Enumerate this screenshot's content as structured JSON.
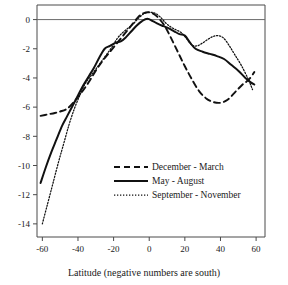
{
  "chart_data": {
    "type": "line",
    "title": "",
    "xlabel": "Latitude (negative numbers are south)",
    "ylabel": "",
    "xlim": [
      -63,
      65
    ],
    "ylim": [
      -14.9,
      1.0
    ],
    "xticks": [
      -60,
      -40,
      -20,
      0,
      20,
      40,
      60
    ],
    "yticks": [
      0,
      -2,
      -4,
      -6,
      -8,
      -10,
      -12,
      -14
    ],
    "xtick_labels": [
      "-60",
      "-40",
      "-20",
      "0",
      "20",
      "40",
      "60"
    ],
    "ytick_labels": [
      "0",
      "-2",
      "-4",
      "-6",
      "-8",
      "-10",
      "-12",
      "-14"
    ],
    "grid": false,
    "zero_line": 0,
    "legend_position": "center",
    "series": [
      {
        "name": "December - March",
        "style": "dashed",
        "color": "#111111",
        "x": [
          -61,
          -57,
          -53,
          -50,
          -46,
          -42,
          -38,
          -34,
          -30,
          -26,
          -22,
          -18,
          -14,
          -10,
          -6,
          -3,
          0,
          3,
          6,
          9,
          12,
          16,
          20,
          24,
          28,
          32,
          36,
          40,
          44,
          48,
          52,
          56,
          59
        ],
        "y": [
          -6.6,
          -6.5,
          -6.4,
          -6.3,
          -6.1,
          -5.6,
          -5.0,
          -4.3,
          -3.5,
          -2.8,
          -2.2,
          -1.6,
          -1.0,
          -0.4,
          0.2,
          0.45,
          0.5,
          0.35,
          0.0,
          -0.5,
          -1.2,
          -2.2,
          -3.2,
          -4.1,
          -4.9,
          -5.4,
          -5.65,
          -5.7,
          -5.5,
          -5.0,
          -4.5,
          -4.1,
          -3.6
        ]
      },
      {
        "name": "May - August",
        "style": "solid",
        "color": "#111111",
        "x": [
          -61,
          -58,
          -55,
          -52,
          -49,
          -46,
          -43,
          -40,
          -37,
          -34,
          -31,
          -28,
          -25,
          -22,
          -19,
          -16,
          -13,
          -10,
          -7,
          -4,
          -1,
          2,
          5,
          8,
          11,
          14,
          17,
          20,
          23,
          26,
          30,
          34,
          38,
          42,
          46,
          50,
          54,
          57,
          59
        ],
        "y": [
          -11.2,
          -10.1,
          -9.1,
          -8.2,
          -7.3,
          -6.6,
          -5.9,
          -5.2,
          -4.5,
          -3.9,
          -3.3,
          -2.6,
          -2.0,
          -1.8,
          -1.6,
          -1.5,
          -1.2,
          -0.8,
          -0.4,
          -0.1,
          0.05,
          -0.1,
          -0.3,
          -0.45,
          -0.6,
          -0.8,
          -1.0,
          -1.1,
          -1.6,
          -2.0,
          -2.2,
          -2.35,
          -2.5,
          -2.7,
          -3.1,
          -3.5,
          -4.0,
          -4.3,
          -4.45
        ]
      },
      {
        "name": "September - November",
        "style": "dotted",
        "color": "#111111",
        "x": [
          -60,
          -57,
          -54,
          -51,
          -48,
          -45,
          -42,
          -39,
          -36,
          -33,
          -30,
          -27,
          -24,
          -21,
          -18,
          -15,
          -12,
          -9,
          -6,
          -3,
          0,
          3,
          6,
          9,
          12,
          15,
          18,
          21,
          24,
          27,
          30,
          33,
          36,
          39,
          42,
          45,
          48,
          52,
          56,
          58
        ],
        "y": [
          -14.0,
          -12.6,
          -11.2,
          -9.8,
          -8.5,
          -7.2,
          -6.1,
          -5.2,
          -4.4,
          -3.9,
          -3.4,
          -2.9,
          -2.4,
          -1.9,
          -1.3,
          -0.9,
          -0.6,
          -0.3,
          0.1,
          0.4,
          0.5,
          0.45,
          0.2,
          -0.2,
          -0.5,
          -0.7,
          -0.9,
          -1.3,
          -1.75,
          -1.8,
          -1.6,
          -1.35,
          -1.15,
          -1.1,
          -1.3,
          -1.8,
          -2.4,
          -3.2,
          -4.2,
          -4.8
        ]
      }
    ]
  },
  "legend": {
    "items": [
      {
        "label": "December - March"
      },
      {
        "label": "May - August"
      },
      {
        "label": "September - November"
      }
    ]
  }
}
